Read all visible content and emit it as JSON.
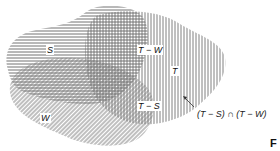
{
  "diagram": {
    "type": "venn",
    "sets": [
      {
        "id": "S",
        "label": "S",
        "hatch": "horizontal"
      },
      {
        "id": "T",
        "label": "T",
        "hatch": "vertical"
      },
      {
        "id": "W",
        "label": "W",
        "hatch": "diagonal"
      }
    ],
    "region_labels": {
      "t_minus_w": "T − W",
      "t_minus_s": "T − S"
    },
    "annotation": "(T − S) ∩ (T − W)",
    "figure_marker": "F"
  },
  "colors": {
    "hatch": "#555555",
    "background": "#ffffff",
    "text": "#111111"
  }
}
